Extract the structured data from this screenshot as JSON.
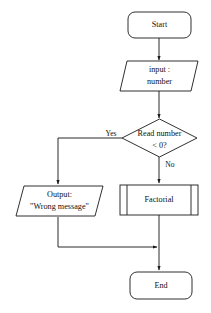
{
  "diagram": {
    "background_color": "#ffffff",
    "stroke_color": "#1a1a1a",
    "text_color": "#111111",
    "nodes": {
      "start": {
        "shape": "terminator",
        "label": "Start"
      },
      "input": {
        "shape": "parallelogram",
        "line1": "input :",
        "line2": "number"
      },
      "decision": {
        "shape": "diamond",
        "line1": "Read number",
        "line2": "< 0?"
      },
      "output": {
        "shape": "parallelogram",
        "line1": "Output:",
        "line2": "\"Wrong message\""
      },
      "factorial": {
        "shape": "predefined-process",
        "label": "Factorial"
      },
      "end": {
        "shape": "terminator",
        "label": "End"
      }
    },
    "edges": {
      "yes_label": "Yes",
      "no_label": "No"
    }
  }
}
